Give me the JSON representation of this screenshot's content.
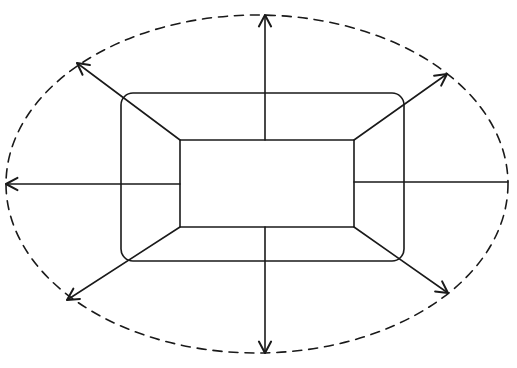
{
  "diagram": {
    "type": "expansion-diagram",
    "colors": {
      "background": "#ffffff",
      "ink": "#1a1a1a"
    },
    "stroke_width": 1.6,
    "boundary": {
      "shape": "ellipse",
      "style": "dashed",
      "cx": 257,
      "cy": 184,
      "rx": 251,
      "ry": 169,
      "dash": "9 7"
    },
    "outer_rect": {
      "x": 121,
      "y": 93,
      "width": 283,
      "height": 168,
      "radius": 12
    },
    "inner_rect": {
      "x": 180,
      "y": 140,
      "width": 174,
      "height": 87
    },
    "arrows": [
      {
        "id": "up",
        "x1": 265,
        "y1": 140,
        "x2": 265,
        "y2": 15,
        "head": true
      },
      {
        "id": "down",
        "x1": 265,
        "y1": 227,
        "x2": 265,
        "y2": 353,
        "head": true
      },
      {
        "id": "left",
        "x1": 180,
        "y1": 184,
        "x2": 6,
        "y2": 184,
        "head": true
      },
      {
        "id": "right",
        "x1": 354,
        "y1": 182,
        "x2": 508,
        "y2": 182,
        "head": false
      },
      {
        "id": "top-left",
        "x1": 180,
        "y1": 140,
        "x2": 77,
        "y2": 63,
        "head": true
      },
      {
        "id": "top-right",
        "x1": 354,
        "y1": 140,
        "x2": 447,
        "y2": 74,
        "head": true
      },
      {
        "id": "bottom-left",
        "x1": 180,
        "y1": 227,
        "x2": 67,
        "y2": 300,
        "head": true
      },
      {
        "id": "bottom-right",
        "x1": 354,
        "y1": 227,
        "x2": 448,
        "y2": 293,
        "head": true
      }
    ],
    "arrowhead": {
      "length": 13,
      "spread_deg": 28
    }
  }
}
